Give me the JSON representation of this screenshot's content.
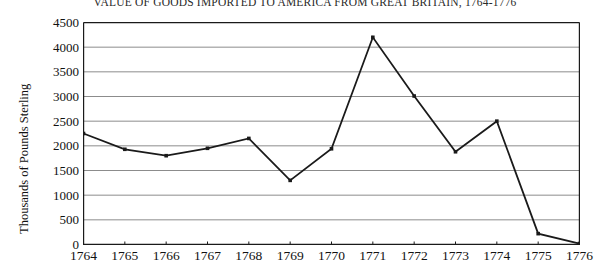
{
  "chart_data": {
    "type": "line",
    "title": "VALUE OF GOODS IMPORTED TO AMERICA FROM GREAT BRITAIN, 1764-1776",
    "xlabel": "",
    "ylabel": "Thousands of Pounds Sterling",
    "categories": [
      "1764",
      "1765",
      "1766",
      "1767",
      "1768",
      "1769",
      "1770",
      "1771",
      "1772",
      "1773",
      "1774",
      "1775",
      "1776"
    ],
    "values": [
      2250,
      1930,
      1800,
      1950,
      2150,
      1300,
      1940,
      4200,
      3010,
      1880,
      2500,
      220,
      20
    ],
    "ylim": [
      0,
      4500
    ],
    "ytick_labels": [
      "4500",
      "4000",
      "3500",
      "3000",
      "2500",
      "2000",
      "1500",
      "1000",
      "500",
      "0"
    ],
    "ytick_values": [
      4500,
      4000,
      3500,
      3000,
      2500,
      2000,
      1500,
      1000,
      500,
      0
    ],
    "grid": true,
    "legend": "none",
    "series_color": "#1a1a1a",
    "grid_color": "#8c8c8c",
    "axis_color": "#1a1a1a",
    "marker": "square",
    "background": "#ffffff"
  }
}
